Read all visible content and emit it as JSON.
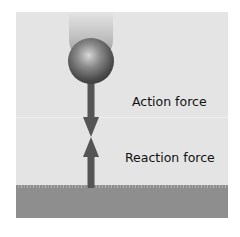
{
  "diagram": {
    "labels": {
      "action": "Action force",
      "reaction": "Reaction force"
    },
    "elements": {
      "ball": "falling ball with motion trail",
      "ground": "textured ground surface",
      "arrow_down": "action force arrow pointing down",
      "arrow_up": "reaction force arrow pointing up"
    },
    "colors": {
      "background": "#e4e4e4",
      "ground": "#8e8e8e",
      "arrow": "#555555",
      "text": "#111111"
    }
  }
}
